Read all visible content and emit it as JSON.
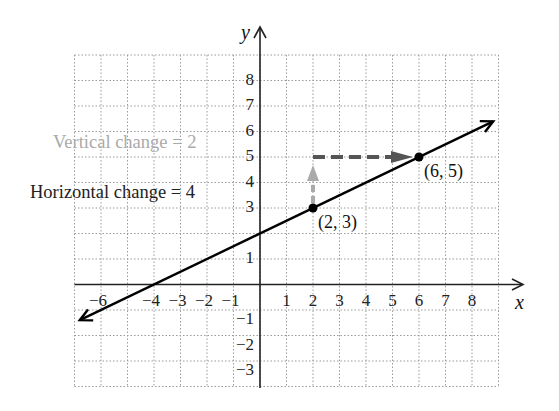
{
  "chart_data": {
    "type": "line",
    "title": "",
    "xlabel": "x",
    "ylabel": "y",
    "xlim": [
      -7,
      9
    ],
    "ylim": [
      -4,
      9
    ],
    "grid": true,
    "grid_style": "dotted",
    "x_ticks": [
      -6,
      -4,
      -3,
      -2,
      -1,
      1,
      2,
      3,
      4,
      5,
      6,
      7,
      8
    ],
    "x_tick_labels": [
      "−6",
      "−4",
      "−3",
      "−2",
      "−1",
      "1",
      "2",
      "3",
      "4",
      "5",
      "6",
      "7",
      "8"
    ],
    "y_ticks": [
      -3,
      -2,
      -1,
      1,
      3,
      4,
      5,
      6,
      7,
      8
    ],
    "y_tick_labels": [
      "−3",
      "−2",
      "−1",
      "1",
      "3",
      "4",
      "5",
      "6",
      "7",
      "8"
    ],
    "series": [
      {
        "name": "line",
        "equation": "y = 0.5x + 2",
        "slope": 0.5,
        "intercept": 2,
        "x": [
          -6.8,
          8.8
        ],
        "y": [
          -1.4,
          6.4
        ],
        "arrows_both_ends": true,
        "color": "#000000"
      }
    ],
    "points": [
      {
        "x": 2,
        "y": 3,
        "label": "(2, 3)"
      },
      {
        "x": 6,
        "y": 5,
        "label": "(6, 5)"
      }
    ],
    "annotations": [
      {
        "type": "dashed-arrow",
        "from": [
          2,
          3
        ],
        "to": [
          2,
          5
        ],
        "color": "#aaaaaa",
        "label": "Vertical change = 2"
      },
      {
        "type": "dashed-arrow",
        "from": [
          2,
          5
        ],
        "to": [
          6,
          5
        ],
        "color": "#555555",
        "label": "Horizontal change = 4"
      }
    ]
  },
  "labels": {
    "vertical_change": "Vertical change = 2",
    "horizontal_change": "Horizontal change = 4",
    "point_a": "(2, 3)",
    "point_b": "(6, 5)",
    "x_axis": "x",
    "y_axis": "y"
  },
  "colors": {
    "grid": "#9a9a9a",
    "axis": "#222222",
    "line": "#000000",
    "vertical_arrow": "#aaaaaa",
    "horizontal_arrow": "#555555",
    "vertical_label": "#aaaaaa",
    "horizontal_label": "#222222"
  }
}
